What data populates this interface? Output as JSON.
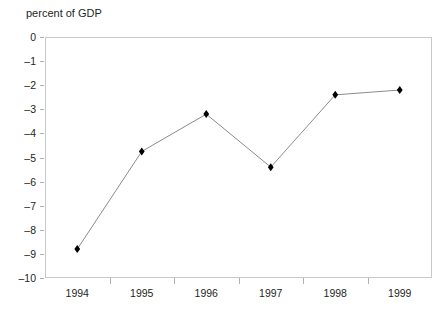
{
  "chart_data": {
    "type": "line",
    "title": "percent of GDP",
    "xlabel": "",
    "ylabel": "",
    "categories": [
      "1994",
      "1995",
      "1996",
      "1997",
      "1998",
      "1999"
    ],
    "values": [
      -8.8,
      -4.75,
      -3.2,
      -5.4,
      -2.4,
      -2.2
    ],
    "ylim": [
      -10,
      0
    ],
    "yticks": [
      "0",
      "–1",
      "–2",
      "–3",
      "–4",
      "–5",
      "–6",
      "–7",
      "–8",
      "–9",
      "–10"
    ],
    "ytick_values": [
      0,
      -1,
      -2,
      -3,
      -4,
      -5,
      -6,
      -7,
      -8,
      -9,
      -10
    ],
    "grid": false,
    "legend": "none",
    "marker": "diamond",
    "marker_color": "#000000",
    "line_color": "#8c8c8c",
    "frame_color": "#c9c9c9"
  }
}
